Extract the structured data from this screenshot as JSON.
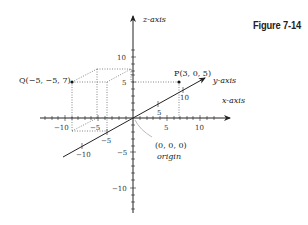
{
  "figure": {
    "label": "Figure 7-14"
  },
  "axes": {
    "z": {
      "label": "z-axis",
      "ticks_positive": [
        "10",
        "5"
      ],
      "ticks_negative": [
        "−5",
        "−10"
      ]
    },
    "x": {
      "label": "x-axis",
      "ticks_negative": [
        "−10",
        "−5"
      ],
      "ticks_positive": [
        "5",
        "10"
      ]
    },
    "y": {
      "label": "y-axis",
      "ticks_positive": [
        "5",
        "10"
      ],
      "ticks_negative": [
        "−5",
        "−10"
      ]
    }
  },
  "points": {
    "P": {
      "label": "P(3, 0, 5)",
      "coords": [
        3,
        0,
        5
      ]
    },
    "Q": {
      "label": "Q(−5, −5, 7)",
      "coords": [
        -5,
        -5,
        7
      ]
    },
    "origin": {
      "coords_label": "(0, 0, 0)",
      "name_label": "origin"
    }
  },
  "colors": {
    "axis": "#222222",
    "guide": "#555555",
    "pointer": "#aaaaaa"
  }
}
